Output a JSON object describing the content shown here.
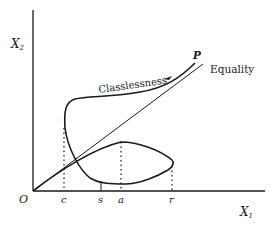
{
  "diagram": {
    "axes": {
      "y_label": "X",
      "y_label_sub": "2",
      "x_label": "X",
      "x_label_sub": "1",
      "origin_label": "O"
    },
    "ticks": [
      {
        "label": "c"
      },
      {
        "label": "s"
      },
      {
        "label": "a"
      },
      {
        "label": "r"
      }
    ],
    "curves": {
      "classlessness_label": "Classlessness",
      "equality_label": "Equality",
      "endpoint_label": "P"
    },
    "colors": {
      "ink": "#1a1a1a",
      "background": "#ffffff"
    }
  }
}
